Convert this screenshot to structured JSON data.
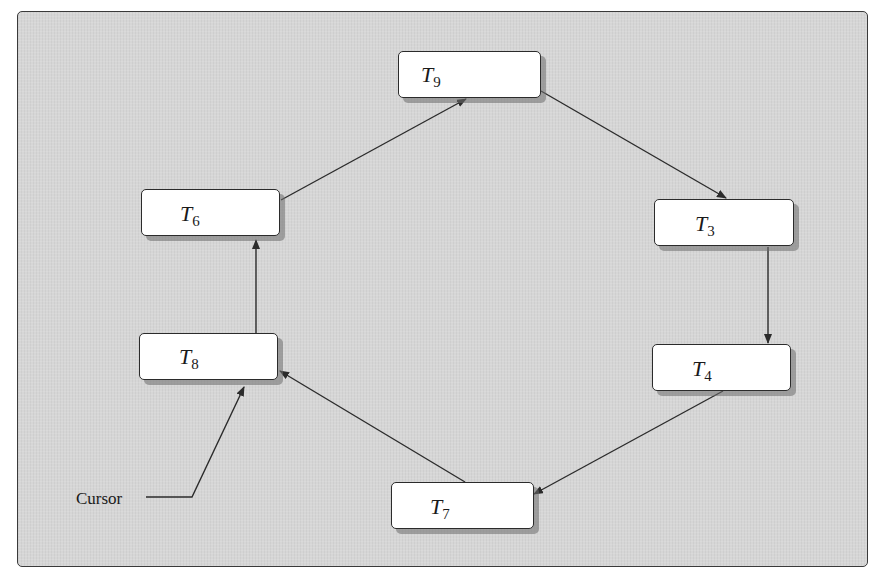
{
  "diagram": {
    "type": "circular-linked-list",
    "background_color": "#d6d6d6",
    "node_color": "#ffffff",
    "line_color": "#2b2b2b",
    "nodes": [
      {
        "id": "T9",
        "letter": "T",
        "sub": "9"
      },
      {
        "id": "T3",
        "letter": "T",
        "sub": "3"
      },
      {
        "id": "T4",
        "letter": "T",
        "sub": "4"
      },
      {
        "id": "T7",
        "letter": "T",
        "sub": "7"
      },
      {
        "id": "T8",
        "letter": "T",
        "sub": "8"
      },
      {
        "id": "T6",
        "letter": "T",
        "sub": "6"
      }
    ],
    "edges": [
      {
        "from": "T9",
        "to": "T3"
      },
      {
        "from": "T3",
        "to": "T4"
      },
      {
        "from": "T4",
        "to": "T7"
      },
      {
        "from": "T7",
        "to": "T8"
      },
      {
        "from": "T8",
        "to": "T6"
      },
      {
        "from": "T6",
        "to": "T9"
      }
    ],
    "pointer": {
      "label": "Cursor",
      "points_to": "T8"
    }
  }
}
